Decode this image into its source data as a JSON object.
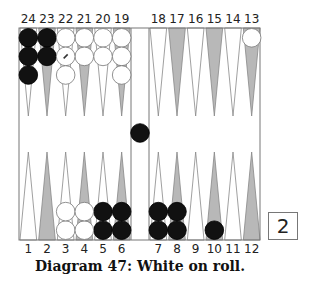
{
  "diagram": {
    "caption": "Diagram 47:  White on roll.",
    "cube_value": "2",
    "colors": {
      "black_checker": "#111111",
      "white_checker": "#ffffff",
      "dark_point": "#b8b8b8",
      "light_point": "#ffffff",
      "border": "#777777"
    },
    "top_labels": [
      "24",
      "23",
      "22",
      "21",
      "20",
      "19",
      "18",
      "17",
      "16",
      "15",
      "14",
      "13"
    ],
    "bottom_labels": [
      "1",
      "2",
      "3",
      "4",
      "5",
      "6",
      "7",
      "8",
      "9",
      "10",
      "11",
      "12"
    ],
    "positions": {
      "black": {
        "24": 3,
        "23": 2,
        "bar": 1,
        "5": 2,
        "6": 2,
        "7": 2,
        "8": 2,
        "10": 1
      },
      "white": {
        "22": 3,
        "21": 2,
        "20": 2,
        "19": 3,
        "13": 1,
        "3": 2,
        "4": 2
      }
    },
    "marked_checker": {
      "point": "22",
      "index": 1,
      "color": "white"
    }
  }
}
